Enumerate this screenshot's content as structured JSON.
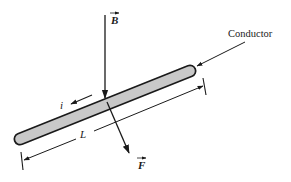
{
  "diagram": {
    "labels": {
      "magnetic_field": "B",
      "force": "F",
      "current": "i",
      "length": "L",
      "conductor": "Conductor"
    },
    "colors": {
      "stroke": "#1a1a1a",
      "rod_fill": "#c8c8c8",
      "background": "#ffffff"
    },
    "elements": [
      {
        "name": "magnetic-field-vector",
        "direction": "down"
      },
      {
        "name": "conductor-rod",
        "orientation": "diagonal"
      },
      {
        "name": "current-arrow",
        "direction": "along rod toward lower-left"
      },
      {
        "name": "length-dimension",
        "label": "L"
      },
      {
        "name": "force-vector",
        "direction": "down-right, perpendicular to rod"
      }
    ]
  }
}
